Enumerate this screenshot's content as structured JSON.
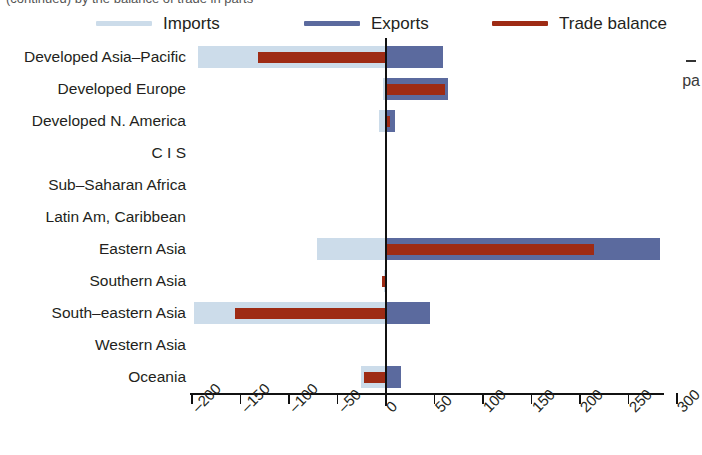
{
  "top_fragment": "(continued) by the balance of trade in parts",
  "right_fragment": "pa",
  "legend": {
    "items": [
      {
        "label": "Imports",
        "color": "#ccdcea",
        "name": "legend-imports"
      },
      {
        "label": "Exports",
        "color": "#5b6a9e",
        "name": "legend-exports"
      },
      {
        "label": "Trade balance",
        "color": "#9e2b14",
        "name": "legend-trade-balance"
      }
    ]
  },
  "colors": {
    "imports": "#ccdcea",
    "exports": "#5b6a9e",
    "balance": "#9e2b14",
    "axis": "#111111",
    "text": "#231f20"
  },
  "chart_data": {
    "type": "bar",
    "orientation": "horizontal",
    "title": "",
    "xlabel": "",
    "ylabel": "",
    "xlim": [
      -200,
      300
    ],
    "xticks": [
      -200,
      -150,
      -100,
      -50,
      0,
      50,
      100,
      150,
      200,
      250,
      300
    ],
    "grid": false,
    "legend_position": "top",
    "categories": [
      "Developed Asia–Pacific",
      "Developed Europe",
      "Developed N. America",
      "C I S",
      "Sub–Saharan Africa",
      "Latin Am, Caribbean",
      "Eastern Asia",
      "Southern Asia",
      "South–eastern Asia",
      "Western Asia",
      "Oceania"
    ],
    "series": [
      {
        "name": "Imports",
        "values": [
          -193,
          -2,
          -6,
          0,
          0,
          0,
          -70,
          -1,
          -197,
          0,
          -25
        ]
      },
      {
        "name": "Exports",
        "values": [
          60,
          65,
          10,
          0,
          0,
          0,
          283,
          1,
          46,
          0,
          16
        ]
      },
      {
        "name": "Trade balance",
        "values": [
          -131,
          62,
          5,
          0,
          0,
          0,
          215,
          -3,
          -155,
          0,
          -22
        ]
      }
    ]
  }
}
